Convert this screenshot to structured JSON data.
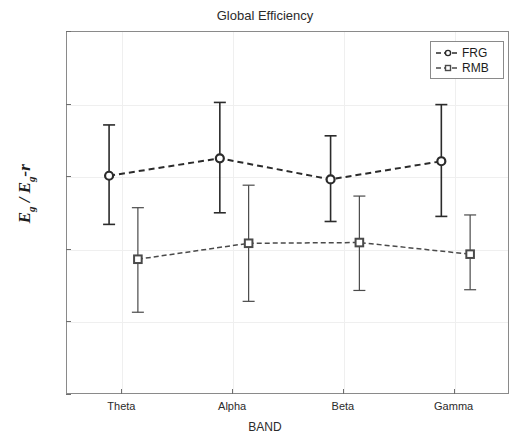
{
  "figure": {
    "title": "Global Efficiency",
    "xlabel": "BAND",
    "ylabel_main": "E",
    "ylabel_sub1": "g",
    "ylabel_mid": " / E",
    "ylabel_sub2": "g",
    "ylabel_tail": "-r"
  },
  "legend": {
    "position": "top-right",
    "entries": [
      {
        "label": "FRG",
        "marker": "circle",
        "linestyle": "dashed",
        "color": "#2b2b2b"
      },
      {
        "label": "RMB",
        "marker": "square",
        "linestyle": "dashed",
        "color": "#4a4a4a"
      }
    ]
  },
  "axes": {
    "y_ticks": [
      "0.5",
      "0.6",
      "0.7",
      "0.8",
      "0.9",
      "1"
    ],
    "y_tick_values": [
      0.5,
      0.6,
      0.7,
      0.8,
      0.9,
      1.0
    ],
    "x_ticks": [
      "Theta",
      "Alpha",
      "Beta",
      "Gamma"
    ],
    "ylim": [
      0.5,
      1.0
    ],
    "grid": "light horizontal and vertical"
  },
  "chart_data": {
    "type": "line",
    "title": "Global Efficiency",
    "xlabel": "BAND",
    "ylabel": "Eg / Eg-r",
    "categories": [
      "Theta",
      "Alpha",
      "Beta",
      "Gamma"
    ],
    "ylim": [
      0.5,
      1.0
    ],
    "yticks": [
      0.5,
      0.6,
      0.7,
      0.8,
      0.9,
      1.0
    ],
    "grid": true,
    "legend_position": "upper right",
    "errorbars": true,
    "series": [
      {
        "name": "FRG",
        "marker": "circle",
        "linestyle": "dashed",
        "color": "#2b2b2b",
        "values": [
          0.802,
          0.826,
          0.797,
          0.822
        ],
        "err_low": [
          0.735,
          0.751,
          0.739,
          0.746
        ],
        "err_high": [
          0.872,
          0.903,
          0.857,
          0.9
        ],
        "x_offsets": [
          -0.12,
          -0.12,
          -0.12,
          -0.12
        ]
      },
      {
        "name": "RMB",
        "marker": "square",
        "linestyle": "dashed",
        "color": "#4a4a4a",
        "values": [
          0.687,
          0.709,
          0.71,
          0.694
        ],
        "err_low": [
          0.614,
          0.629,
          0.644,
          0.645
        ],
        "err_high": [
          0.758,
          0.789,
          0.774,
          0.748
        ],
        "x_offsets": [
          0.14,
          0.14,
          0.14,
          0.14
        ]
      }
    ]
  }
}
